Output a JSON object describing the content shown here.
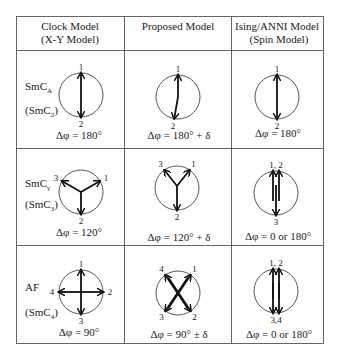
{
  "headers": [
    {
      "line1": "Clock Model",
      "line2": "(X-Y Model)"
    },
    {
      "line1": "Proposed Model",
      "line2": ""
    },
    {
      "line1": "Ising/ANNI Model",
      "line2": "(Spin Model)"
    }
  ],
  "rows": [
    {
      "phase": {
        "name": "SmC",
        "name_sub": "A",
        "alt": "(SmC",
        "alt_sub": "2",
        "alt_close": ")"
      },
      "cells": [
        {
          "model": "clock",
          "arrows": [
            {
              "label": "1",
              "angle": 90
            },
            {
              "label": "2",
              "angle": 270
            }
          ],
          "equation": "Δφ = 180°"
        },
        {
          "model": "proposed",
          "arrows": [
            {
              "label": "1",
              "angle": 90
            },
            {
              "label": "2",
              "angle": 260
            }
          ],
          "equation": "Δφ = 180° + δ"
        },
        {
          "model": "ising",
          "arrows": [
            {
              "label": "1",
              "angle": 90
            },
            {
              "label": "2",
              "angle": 270
            }
          ],
          "equation": "Δφ = 180°"
        }
      ]
    },
    {
      "phase": {
        "name": "SmC",
        "name_sub": "γ",
        "alt": "(SmC",
        "alt_sub": "3",
        "alt_close": ")"
      },
      "cells": [
        {
          "model": "clock",
          "arrows": [
            {
              "label": "1",
              "angle": 30
            },
            {
              "label": "2",
              "angle": 270
            },
            {
              "label": "3",
              "angle": 150
            }
          ],
          "equation": "Δφ = 120°"
        },
        {
          "model": "proposed",
          "arrows": [
            {
              "label": "1",
              "angle": 55
            },
            {
              "label": "2",
              "angle": 270
            },
            {
              "label": "3",
              "angle": 125
            }
          ],
          "equation": "Δφ = 120° + δ"
        },
        {
          "model": "ising",
          "arrows": [
            {
              "label": "1, 2",
              "angle": 90
            },
            {
              "label": "3",
              "angle": 270
            }
          ],
          "equation": "Δφ = 0 or 180°"
        }
      ]
    },
    {
      "phase": {
        "name": "AF",
        "name_sub": "",
        "alt": "(SmC",
        "alt_sub": "4",
        "alt_close": ")"
      },
      "cells": [
        {
          "model": "clock",
          "arrows": [
            {
              "label": "1",
              "angle": 90
            },
            {
              "label": "2",
              "angle": 0
            },
            {
              "label": "3",
              "angle": 270
            },
            {
              "label": "4",
              "angle": 180
            }
          ],
          "equation": "Δφ = 90°"
        },
        {
          "model": "proposed",
          "arrows": [
            {
              "label": "1",
              "angle": 55
            },
            {
              "label": "2",
              "angle": 305
            },
            {
              "label": "3",
              "angle": 235
            },
            {
              "label": "4",
              "angle": 125
            }
          ],
          "equation": "Δφ = 90° ± δ"
        },
        {
          "model": "ising",
          "arrows": [
            {
              "label": "1, 2",
              "angle": 90
            },
            {
              "label": "3,4",
              "angle": 270
            }
          ],
          "equation": "Δφ = 0 or 180°"
        }
      ]
    }
  ]
}
